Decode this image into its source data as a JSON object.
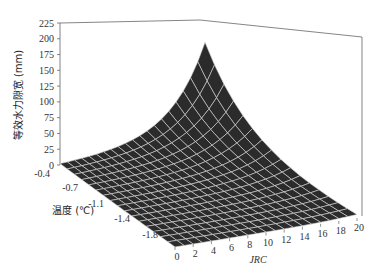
{
  "chart_data": {
    "type": "surface3d",
    "title": "",
    "zlabel": "等效水力隙宽 (mm)",
    "xlabel": "JRC",
    "ylabel": "温度 (℃)",
    "z_ticks": [
      "0",
      "25",
      "50",
      "75",
      "100",
      "125",
      "150",
      "175",
      "200",
      "225"
    ],
    "zlim": [
      0,
      225
    ],
    "y_ticks": [
      "-0.4",
      "-0.7",
      "-1.1",
      "-1.4",
      "-1.8"
    ],
    "x_ticks": [
      "0",
      "2",
      "4",
      "6",
      "8",
      "10",
      "12",
      "14",
      "16",
      "18",
      "20"
    ],
    "xlim": [
      0,
      20
    ],
    "ylim": [
      -0.4,
      -2.0
    ],
    "grid": false,
    "surface": {
      "x": [
        0,
        1,
        2,
        3,
        4,
        5,
        6,
        7,
        8,
        9,
        10,
        11,
        12,
        13,
        14,
        15,
        16,
        17,
        18,
        19,
        20
      ],
      "y": [
        -0.4,
        -0.5,
        -0.6,
        -0.7,
        -0.8,
        -0.9,
        -1.0,
        -1.1,
        -1.2,
        -1.3,
        -1.4,
        -1.5,
        -1.6,
        -1.7,
        -1.8,
        -1.9,
        -2.0
      ],
      "peak_value": 215,
      "peak_at": {
        "x": 20,
        "y": -0.4
      },
      "min_value": 0,
      "description": "Dark surface with white mesh; value rises exponentially toward JRC=20 and temperature=-0.4, near zero elsewhere"
    },
    "surface_color": "#2b2b2b",
    "mesh_color": "#d8d8d8"
  }
}
